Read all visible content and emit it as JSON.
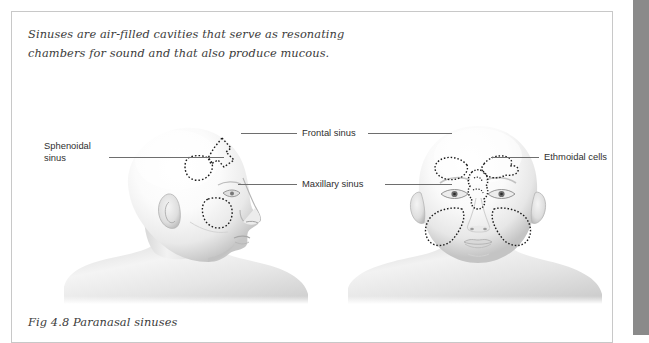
{
  "figure": {
    "intro_lines": [
      "Sinuses are air-filled cavities that serve as resonating",
      "chambers for sound and that also produce mucous."
    ],
    "caption": "Fig 4.8 Paranasal sinuses",
    "labels": {
      "sphenoidal_line1": "Sphenoidal",
      "sphenoidal_line2": "sinus",
      "frontal": "Frontal sinus",
      "maxillary": "Maxillary sinus",
      "ethmoidal": "Ethmoidal cells"
    },
    "illustration": {
      "left_view_name": "lateral-head-profile",
      "right_view_name": "frontal-head-view"
    },
    "colors": {
      "border": "#c8c8c8",
      "gutter": "#8a8a8a",
      "text": "#3b3b3b",
      "label_text": "#2f2f2f",
      "leader_line": "#6e6e6e",
      "skin_light": "#f7f7f7",
      "skin_shade": "#c9c9c9",
      "outline_dotted": "#1a1a1a"
    }
  }
}
